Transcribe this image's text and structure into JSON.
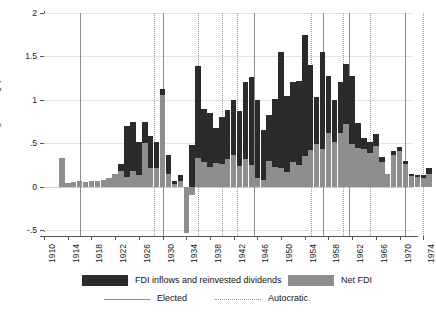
{
  "chart_data": {
    "type": "bar",
    "title": "",
    "subtitle": "",
    "xlabel": "",
    "ylabel": "FDI/GDP (percentage)",
    "ylim": [
      -0.5,
      2
    ],
    "xlim": [
      1910,
      1976
    ],
    "grid": true,
    "bar_mode": "overlaid",
    "y_ticks": [
      "2",
      "1.5",
      "1",
      ".5",
      "0",
      "-.5"
    ],
    "y_tick_values": [
      2,
      1.5,
      1,
      0.5,
      0,
      -0.5
    ],
    "x_ticks": [
      "1910",
      "1914",
      "1918",
      "1922",
      "1926",
      "1930",
      "1934",
      "1938",
      "1942",
      "1946",
      "1950",
      "1954",
      "1958",
      "1962",
      "1966",
      "1970",
      "1974"
    ],
    "x_tick_values": [
      1910,
      1914,
      1918,
      1922,
      1926,
      1930,
      1934,
      1938,
      1942,
      1946,
      1950,
      1954,
      1958,
      1962,
      1966,
      1970,
      1974
    ],
    "legend_position": "bottom",
    "series": [
      {
        "name": "FDI inflows and reinvested dividends",
        "color": "#2b2b2b",
        "x": [
          1913,
          1914,
          1915,
          1916,
          1917,
          1918,
          1919,
          1920,
          1921,
          1922,
          1923,
          1924,
          1925,
          1926,
          1927,
          1928,
          1929,
          1930,
          1931,
          1932,
          1933,
          1934,
          1935,
          1936,
          1937,
          1938,
          1939,
          1940,
          1941,
          1942,
          1943,
          1944,
          1945,
          1946,
          1947,
          1948,
          1949,
          1950,
          1951,
          1952,
          1953,
          1954,
          1955,
          1956,
          1957,
          1958,
          1959,
          1960,
          1961,
          1962,
          1963,
          1964,
          1965,
          1966,
          1967,
          1968,
          1969,
          1970,
          1971,
          1972,
          1973,
          1974,
          1975
        ],
        "values": [
          0.33,
          0.04,
          0.05,
          0.06,
          0.05,
          0.06,
          0.07,
          0.08,
          0.1,
          0.14,
          0.26,
          0.7,
          0.75,
          0.51,
          0.75,
          0.58,
          0.52,
          1.13,
          0.37,
          0.06,
          0.13,
          0.0,
          0.48,
          1.39,
          0.9,
          0.85,
          0.67,
          0.8,
          0.88,
          1.0,
          0.87,
          1.21,
          1.26,
          1.0,
          0.65,
          0.82,
          1.01,
          1.55,
          1.05,
          1.2,
          1.22,
          1.75,
          1.4,
          1.03,
          1.55,
          1.28,
          1.0,
          1.2,
          1.41,
          1.27,
          0.73,
          0.56,
          0.52,
          0.61,
          0.34,
          0.15,
          0.41,
          0.46,
          0.3,
          0.15,
          0.13,
          0.13,
          0.22
        ]
      },
      {
        "name": "Net FDI",
        "color": "#8e8e8e",
        "x": [
          1913,
          1914,
          1915,
          1916,
          1917,
          1918,
          1919,
          1920,
          1921,
          1922,
          1923,
          1924,
          1925,
          1926,
          1927,
          1928,
          1929,
          1930,
          1931,
          1932,
          1933,
          1934,
          1935,
          1936,
          1937,
          1938,
          1939,
          1940,
          1941,
          1942,
          1943,
          1944,
          1945,
          1946,
          1947,
          1948,
          1949,
          1950,
          1951,
          1952,
          1953,
          1954,
          1955,
          1956,
          1957,
          1958,
          1959,
          1960,
          1961,
          1962,
          1963,
          1964,
          1965,
          1966,
          1967,
          1968,
          1969,
          1970,
          1971,
          1972,
          1973,
          1974,
          1975
        ],
        "values": [
          0.33,
          0.04,
          0.05,
          0.06,
          0.05,
          0.06,
          0.07,
          0.08,
          0.1,
          0.14,
          0.18,
          0.11,
          0.18,
          0.13,
          0.5,
          0.22,
          0.21,
          1.06,
          0.14,
          0.03,
          0.06,
          -0.53,
          -0.1,
          0.33,
          0.28,
          0.23,
          0.27,
          0.26,
          0.32,
          0.37,
          0.24,
          0.32,
          0.25,
          0.1,
          0.08,
          0.3,
          0.23,
          0.21,
          0.17,
          0.28,
          0.25,
          0.35,
          0.42,
          0.49,
          0.43,
          0.62,
          0.51,
          0.62,
          0.72,
          0.49,
          0.45,
          0.43,
          0.39,
          0.47,
          0.28,
          0.14,
          0.36,
          0.41,
          0.26,
          0.12,
          0.11,
          0.1,
          0.14
        ]
      }
    ],
    "reference_lines": [
      {
        "type": "elected",
        "x": 1916.0
      },
      {
        "type": "autocratic",
        "x": 1928.5
      },
      {
        "type": "elected",
        "x": 1930.0
      },
      {
        "type": "autocratic",
        "x": 1936.0
      },
      {
        "type": "autocratic",
        "x": 1940.0
      },
      {
        "type": "autocratic",
        "x": 1942.5
      },
      {
        "type": "elected",
        "x": 1945.5
      },
      {
        "type": "autocratic",
        "x": 1955.0
      },
      {
        "type": "elected",
        "x": 1957.0
      },
      {
        "type": "autocratic",
        "x": 1960.5
      },
      {
        "type": "elected",
        "x": 1961.5
      },
      {
        "type": "autocratic",
        "x": 1965.0
      },
      {
        "type": "elected",
        "x": 1971.0
      },
      {
        "type": "autocratic",
        "x": 1974.0
      }
    ]
  },
  "axis": {
    "y_title": "FDI/GDP (percentage)"
  },
  "legend": {
    "series_1_label": "FDI inflows and reinvested dividends",
    "series_2_label": "Net FDI",
    "line_1_label": "Elected",
    "line_2_label": "Autocratic"
  },
  "colors": {
    "dark_bar": "#2b2b2b",
    "gray_bar": "#8e8e8e",
    "elected_line": "#8c8c8c",
    "autocratic_line": "#9a9a9a",
    "grid": "#e4e4e4",
    "axis": "#555555",
    "background": "#ffffff"
  }
}
